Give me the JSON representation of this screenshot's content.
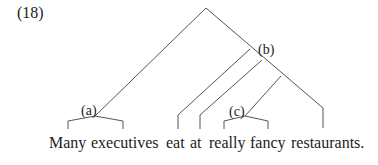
{
  "example_number": "(18)",
  "node_labels": {
    "a": "(a)",
    "b": "(b)",
    "c": "(c)"
  },
  "words": [
    "Many",
    "executives",
    "eat",
    "at",
    "really",
    "fancy",
    "restaurants."
  ],
  "colors": {
    "line": "#555555",
    "text": "#222222",
    "background": "#ffffff"
  }
}
